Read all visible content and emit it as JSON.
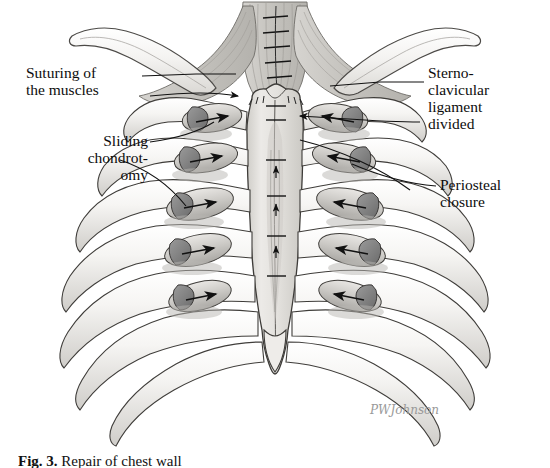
{
  "figure": {
    "type": "medical-illustration",
    "view": "anterior",
    "style": "grayscale pencil / wash drawing",
    "background_color": "#ffffff",
    "ink_color": "#1a1a1a",
    "bone_fill": "#f2f1ef",
    "cartilage_fill": "#d8d7d4",
    "cut_cartilage_fill": "#8c8c8c",
    "muscle_fill": "#cfcdc9",
    "sternum_fill": "#e4e2df",
    "shadow_color": "#b8b6b2"
  },
  "labels": [
    {
      "id": "suturing",
      "text": "Suturing of\nthe muscles",
      "position": "upper-left",
      "leader": "to sternocleidomastoid / pectoral muscle sutures at midline"
    },
    {
      "id": "sliding_chondrotomy",
      "text": "Sliding\nchondrot-\nomy",
      "position": "mid-left",
      "leader": "to beveled costal cartilage cuts on left ribs"
    },
    {
      "id": "sternoclavicular",
      "text": "Sterno-\nclavicular\nligament\ndivided",
      "position": "upper-right",
      "leader": "to sternoclavicular joint region"
    },
    {
      "id": "periosteal",
      "text": "Periosteal\nclosure",
      "position": "mid-right",
      "leader": "to periosteal suture line over right costal margin"
    }
  ],
  "signature": {
    "artist": "PWJohnson",
    "position": "lower-right"
  },
  "caption": {
    "figure_number": "Fig. 3.",
    "text": "Repair of chest wall",
    "visible": "partially cut off at bottom edge"
  },
  "anatomy": {
    "structures": [
      "left clavicle",
      "right clavicle",
      "manubrium",
      "sternal body",
      "xiphoid process",
      "costal cartilages",
      "ribs 1-7",
      "sternocleidomastoid muscles",
      "pectoralis major muscle flaps"
    ],
    "arrow_count": 10,
    "arrow_meaning": "direction of cartilage sliding / approximation",
    "suture_lines": "midline sternal sutures and muscle sutures"
  }
}
